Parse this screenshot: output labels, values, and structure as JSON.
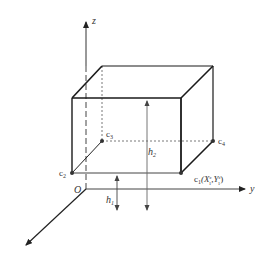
{
  "diagram": {
    "axes": {
      "z_label": "z",
      "y_label": "y",
      "origin_label": "O"
    },
    "corners": {
      "c1": {
        "label": "c",
        "sub": "1",
        "coord_text": "(X",
        "coord_sup1": "c",
        "coord_sub1": "1",
        "coord_mid": ",Y",
        "coord_sup2": "c",
        "coord_sub2": "1",
        "coord_end": ")"
      },
      "c2": {
        "label": "c",
        "sub": "2"
      },
      "c3": {
        "label": "c",
        "sub": "3"
      },
      "c4": {
        "label": "c",
        "sub": "4"
      }
    },
    "heights": {
      "h1": {
        "label": "h",
        "sub": "1"
      },
      "h2": {
        "label": "h",
        "sub": "2"
      }
    },
    "colors": {
      "box_edge": "#1a1a1a",
      "axis": "#333333",
      "hidden_edge": "#555555"
    }
  }
}
